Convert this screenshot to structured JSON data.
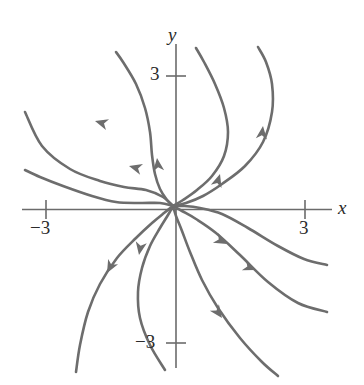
{
  "figure": {
    "kind": "phase-portrait",
    "background_color": "#ffffff",
    "curve_color": "#6d6d6d",
    "axis_color": "#6b6b6b",
    "label_color": "#2b2b2b",
    "width": 364,
    "height": 385
  },
  "axes": {
    "x_label": "x",
    "y_label": "y",
    "ticks": {
      "x_positive": "3",
      "x_negative": "−3",
      "y_positive": "3",
      "y_negative": "−3"
    }
  },
  "chart_data": {
    "type": "line",
    "title": "",
    "xlabel": "x",
    "ylabel": "y",
    "xlim": [
      -3.9,
      4.2
    ],
    "ylim": [
      -4.0,
      3.6
    ],
    "xticks": [
      -3,
      3
    ],
    "yticks": [
      -3,
      3
    ],
    "xticklabels": [
      "−3",
      "3"
    ],
    "yticklabels": [
      "−3",
      "3"
    ],
    "grid": false,
    "legend": null,
    "equilibrium": {
      "x": 0,
      "y": 0,
      "classification": "unstable spiral point",
      "rotation": "counterclockwise"
    },
    "series": [
      {
        "name": "trajectory-1",
        "arrow_direction": "outward",
        "points_px": [
          [
            173,
            206
          ],
          [
            163,
            197
          ],
          [
            146,
            190
          ],
          [
            124,
            187
          ],
          [
            100,
            181
          ],
          [
            70,
            169
          ],
          [
            42,
            146
          ],
          [
            25,
            112
          ]
        ]
      },
      {
        "name": "trajectory-2",
        "arrow_direction": "outward",
        "points_px": [
          [
            173,
            206
          ],
          [
            160,
            203
          ],
          [
            140,
            203
          ],
          [
            116,
            202
          ],
          [
            92,
            196
          ],
          [
            63,
            186
          ],
          [
            40,
            177
          ],
          [
            25,
            170
          ]
        ]
      },
      {
        "name": "trajectory-3",
        "arrow_direction": "outward",
        "points_px": [
          [
            173,
            206
          ],
          [
            164,
            213
          ],
          [
            152,
            223
          ],
          [
            136,
            238
          ],
          [
            117,
            258
          ],
          [
            100,
            284
          ],
          [
            88,
            312
          ],
          [
            80,
            345
          ],
          [
            76,
            372
          ]
        ]
      },
      {
        "name": "trajectory-4",
        "arrow_direction": "outward",
        "points_px": [
          [
            173,
            206
          ],
          [
            168,
            215
          ],
          [
            160,
            228
          ],
          [
            150,
            246
          ],
          [
            142,
            268
          ],
          [
            138,
            292
          ],
          [
            140,
            318
          ],
          [
            150,
            345
          ],
          [
            165,
            370
          ]
        ]
      },
      {
        "name": "trajectory-5",
        "arrow_direction": "outward",
        "points_px": [
          [
            173,
            206
          ],
          [
            176,
            216
          ],
          [
            182,
            231
          ],
          [
            190,
            252
          ],
          [
            202,
            280
          ],
          [
            218,
            308
          ],
          [
            240,
            338
          ],
          [
            262,
            362
          ],
          [
            278,
            376
          ]
        ]
      },
      {
        "name": "trajectory-6",
        "arrow_direction": "outward",
        "points_px": [
          [
            173,
            206
          ],
          [
            182,
            211
          ],
          [
            196,
            219
          ],
          [
            216,
            233
          ],
          [
            240,
            255
          ],
          [
            268,
            282
          ],
          [
            298,
            303
          ],
          [
            327,
            312
          ]
        ]
      },
      {
        "name": "trajectory-7",
        "arrow_direction": "outward",
        "points_px": [
          [
            173,
            206
          ],
          [
            184,
            206
          ],
          [
            200,
            208
          ],
          [
            222,
            214
          ],
          [
            248,
            228
          ],
          [
            278,
            246
          ],
          [
            304,
            259
          ],
          [
            327,
            265
          ]
        ]
      },
      {
        "name": "trajectory-8",
        "arrow_direction": "outward",
        "points_px": [
          [
            173,
            206
          ],
          [
            183,
            200
          ],
          [
            197,
            190
          ],
          [
            212,
            176
          ],
          [
            224,
            156
          ],
          [
            228,
            132
          ],
          [
            224,
            108
          ],
          [
            215,
            84
          ],
          [
            204,
            62
          ],
          [
            196,
            48
          ]
        ]
      },
      {
        "name": "trajectory-9",
        "arrow_direction": "outward",
        "points_px": [
          [
            173,
            206
          ],
          [
            186,
            203
          ],
          [
            203,
            196
          ],
          [
            222,
            184
          ],
          [
            245,
            166
          ],
          [
            263,
            142
          ],
          [
            272,
            112
          ],
          [
            272,
            84
          ],
          [
            266,
            62
          ],
          [
            258,
            47
          ]
        ]
      },
      {
        "name": "trajectory-10",
        "arrow_direction": "outward",
        "points_px": [
          [
            173,
            206
          ],
          [
            167,
            200
          ],
          [
            160,
            189
          ],
          [
            155,
            174
          ],
          [
            152,
            155
          ],
          [
            150,
            132
          ],
          [
            145,
            108
          ],
          [
            136,
            84
          ],
          [
            123,
            62
          ],
          [
            116,
            52
          ]
        ]
      }
    ],
    "arrows_px": [
      {
        "x": 95,
        "y": 121,
        "angle_deg": 196
      },
      {
        "x": 129,
        "y": 166,
        "angle_deg": 195
      },
      {
        "x": 107,
        "y": 273,
        "angle_deg": 118
      },
      {
        "x": 139,
        "y": 255,
        "angle_deg": 100
      },
      {
        "x": 222,
        "y": 318,
        "angle_deg": 54
      },
      {
        "x": 256,
        "y": 270,
        "angle_deg": 22
      },
      {
        "x": 227,
        "y": 244,
        "angle_deg": 28
      },
      {
        "x": 220,
        "y": 174,
        "angle_deg": 287
      },
      {
        "x": 263,
        "y": 126,
        "angle_deg": 277
      },
      {
        "x": 157,
        "y": 158,
        "angle_deg": 263
      }
    ]
  }
}
